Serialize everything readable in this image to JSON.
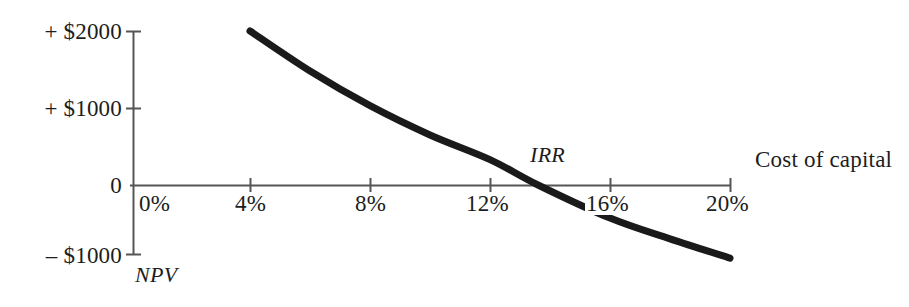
{
  "chart_data": {
    "type": "line",
    "title": "",
    "subtitle": "",
    "xlabel": "Cost of capital",
    "ylabel": "NPV",
    "xlim": [
      0,
      20
    ],
    "ylim": [
      -1000,
      2000
    ],
    "grid": false,
    "legend": null,
    "x_ticks": [
      "0%",
      "4%",
      "8%",
      "12%",
      "16%",
      "20%"
    ],
    "x_tick_values": [
      0,
      4,
      8,
      12,
      16,
      20
    ],
    "y_ticks": [
      "+ $2000",
      "+ $1000",
      "0",
      "– $1000"
    ],
    "y_tick_values": [
      2000,
      1000,
      0,
      -1000
    ],
    "series": [
      {
        "name": "NPV profile",
        "x": [
          4,
          6,
          8,
          10,
          12,
          13.6,
          16,
          18,
          20
        ],
        "values": [
          2000,
          1480,
          1030,
          650,
          330,
          0,
          -430,
          -700,
          -950
        ]
      }
    ],
    "annotations": [
      {
        "name": "irr-label",
        "text": "IRR",
        "x": 13.6,
        "y": 420,
        "style": "italic"
      },
      {
        "name": "npv-axis-label",
        "text": "NPV",
        "x": 0.2,
        "y": -1280,
        "style": "italic"
      },
      {
        "name": "cost-of-capital-label",
        "text": "Cost of capital",
        "x": 20.9,
        "y": 280,
        "style": "roman"
      }
    ],
    "colors": {
      "curve": "#1a1a1a",
      "axis": "#555555",
      "text": "#1d1d1d",
      "background": "#ffffff"
    }
  },
  "axes": {
    "y_tick_2000": "+ $2000",
    "y_tick_1000": "+ $1000",
    "y_tick_0": "0",
    "y_tick_neg1000": "– $1000",
    "x_tick_0": "0%",
    "x_tick_4": "4%",
    "x_tick_8": "8%",
    "x_tick_12": "12%",
    "x_tick_16": "16%",
    "x_tick_20": "20%"
  },
  "labels": {
    "irr": "IRR",
    "npv": "NPV",
    "cost_of_capital": "Cost of capital"
  }
}
